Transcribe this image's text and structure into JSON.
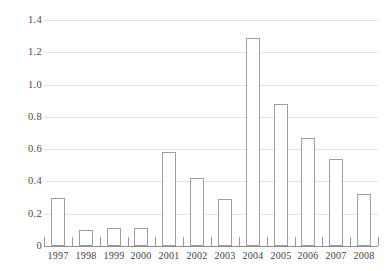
{
  "figure": {
    "cut_off_title": "· · ·",
    "background_color": "#ffffff",
    "gridline_color": "#e3e3e6",
    "axis_color": "#8e8e92",
    "bar_fill_color": "#ffffff",
    "bar_border_color": "#9d9da2",
    "text_color": "#3a3a3a"
  },
  "chart_data": {
    "type": "bar",
    "title": "",
    "subtitle": "",
    "xlabel": "",
    "ylabel": "",
    "categories": [
      "1997",
      "1998",
      "1999",
      "2000",
      "2001",
      "2002",
      "2003",
      "2004",
      "2005",
      "2006",
      "2007",
      "2008"
    ],
    "values": [
      0.3,
      0.1,
      0.11,
      0.11,
      0.58,
      0.42,
      0.29,
      1.29,
      0.88,
      0.67,
      0.54,
      0.32
    ],
    "ylim": [
      0,
      1.4
    ],
    "xlim_categories": 12,
    "yticks": [
      0,
      0.2,
      0.4,
      0.6,
      0.8,
      1.0,
      1.2,
      1.4
    ],
    "ytick_labels": [
      "0",
      "0.2",
      "0.4",
      "0.6",
      "0.8",
      "1.0",
      "1.2",
      "1.4"
    ],
    "grid": true,
    "grid_axis": "y",
    "legend": null,
    "legend_position": "none",
    "annotations": [],
    "series": [
      {
        "name": "",
        "values": [
          0.3,
          0.1,
          0.11,
          0.11,
          0.58,
          0.42,
          0.29,
          1.29,
          0.88,
          0.67,
          0.54,
          0.32
        ]
      }
    ]
  }
}
